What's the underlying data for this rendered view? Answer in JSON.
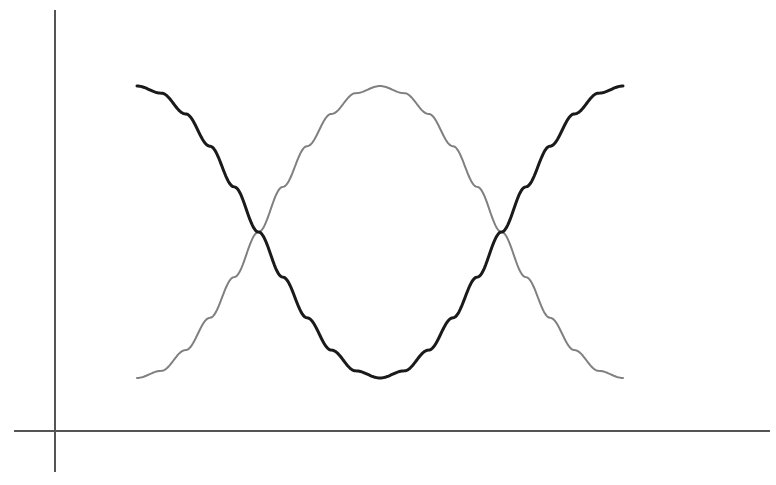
{
  "figure": {
    "width": 776,
    "height": 485,
    "background": "#ffffff"
  },
  "axes": {
    "color": "#555555",
    "line_width": 2,
    "origin": {
      "x": 55,
      "y": 431
    },
    "y_axis": {
      "x": 55,
      "y_top": 10,
      "y_bottom": 472
    },
    "x_axis": {
      "y": 431,
      "x_left": 14,
      "x_right": 770
    }
  },
  "chart_data": {
    "type": "line",
    "title": "",
    "subtitle": "",
    "xlabel": "",
    "ylabel": "",
    "grid": false,
    "legend": null,
    "xlim": [
      0,
      1
    ],
    "ylim": [
      -1,
      1
    ],
    "x_pixel_range": [
      137,
      623
    ],
    "y_pixel_top": 86,
    "y_pixel_bottom": 378,
    "x": [
      0,
      0.05,
      0.1,
      0.15,
      0.2,
      0.25,
      0.3,
      0.35,
      0.4,
      0.45,
      0.5,
      0.55,
      0.6,
      0.65,
      0.7,
      0.75,
      0.8,
      0.85,
      0.9,
      0.95,
      1
    ],
    "series": [
      {
        "name": "cosine",
        "color": "#1a1a1a",
        "line_width": 3,
        "values": [
          1,
          0.951,
          0.809,
          0.588,
          0.309,
          0,
          -0.309,
          -0.588,
          -0.809,
          -0.951,
          -1,
          -0.951,
          -0.809,
          -0.588,
          -0.309,
          0,
          0.309,
          0.588,
          0.809,
          0.951,
          1
        ]
      },
      {
        "name": "inverted-cosine",
        "color": "#808080",
        "line_width": 2,
        "values": [
          -1,
          -0.951,
          -0.809,
          -0.588,
          -0.309,
          0,
          0.309,
          0.588,
          0.809,
          0.951,
          1,
          0.951,
          0.809,
          0.588,
          0.309,
          0,
          -0.309,
          -0.588,
          -0.809,
          -0.951,
          -1
        ]
      }
    ],
    "annotations": {
      "crossings": [
        {
          "x_pixel": 277,
          "y_pixel": 232
        },
        {
          "x_pixel": 478,
          "y_pixel": 232
        }
      ],
      "dark_peak_left": {
        "x_pixel": 137,
        "y_pixel": 88
      },
      "dark_trough": {
        "x_pixel": 380,
        "y_pixel": 378
      },
      "dark_peak_right": {
        "x_pixel": 623,
        "y_pixel": 87
      },
      "gray_trough_left": {
        "x_pixel": 138,
        "y_pixel": 377
      },
      "gray_peak": {
        "x_pixel": 380,
        "y_pixel": 85
      },
      "gray_trough_right": {
        "x_pixel": 622,
        "y_pixel": 377
      }
    }
  }
}
